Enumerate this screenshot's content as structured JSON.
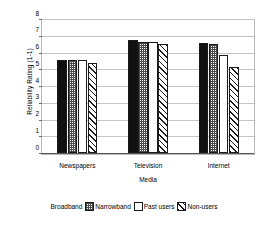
{
  "chart_data": {
    "type": "bar",
    "title": "",
    "xlabel": "Media",
    "ylabel": "Reliability Rating (1-1)",
    "categories": [
      "Newspapers",
      "Television",
      "Internet"
    ],
    "series": [
      {
        "name": "Broadband",
        "values": [
          5.55,
          6.72,
          6.55
        ],
        "fill": "solid"
      },
      {
        "name": "Narrowband",
        "values": [
          5.55,
          6.6,
          6.48
        ],
        "fill": "check"
      },
      {
        "name": "Past users",
        "values": [
          5.55,
          6.65,
          5.88
        ],
        "fill": "white"
      },
      {
        "name": "Non-users",
        "values": [
          5.4,
          6.5,
          5.12
        ],
        "fill": "hatch"
      }
    ],
    "ylim": [
      0,
      8
    ],
    "yticks": [
      "0",
      "1",
      "2",
      "3",
      "4",
      "5",
      "6",
      "7",
      "8"
    ],
    "grid": true,
    "legend_position": "bottom"
  },
  "legend": {
    "entries": [
      {
        "label": "Broadband"
      },
      {
        "label": "Narrowband"
      },
      {
        "label": "Past users"
      },
      {
        "label": "Non-users"
      }
    ]
  }
}
